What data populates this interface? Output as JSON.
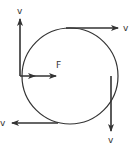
{
  "diagram": {
    "circle": {
      "cx": 70,
      "cy": 76,
      "r": 48
    },
    "velocity_label": "v",
    "force_label": "F",
    "vectors": [
      {
        "name": "velocity-left",
        "label": "v",
        "direction": "up"
      },
      {
        "name": "velocity-top",
        "label": "v",
        "direction": "right"
      },
      {
        "name": "velocity-right",
        "label": "v",
        "direction": "down"
      },
      {
        "name": "velocity-bottom",
        "label": "v",
        "direction": "left"
      },
      {
        "name": "force",
        "label": "F",
        "direction": "toward-center"
      }
    ],
    "colors": {
      "stroke": "#333333",
      "background": "#ffffff"
    }
  }
}
